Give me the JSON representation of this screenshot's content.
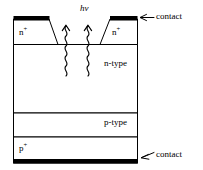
{
  "figure": {
    "type": "semiconductor-cross-section"
  },
  "colors": {
    "line": "#000000",
    "fill": "#ffffff",
    "contact_metal": "#000000",
    "background": "#ffffff"
  },
  "layers": [
    {
      "id": "nplus",
      "label": "n",
      "superscript": "+",
      "label_align": "left"
    },
    {
      "id": "ntype",
      "label": "n-type",
      "superscript": "",
      "label_align": "right"
    },
    {
      "id": "ptype",
      "label": "p-type",
      "superscript": "",
      "label_align": "right"
    },
    {
      "id": "pplus",
      "label": "p",
      "superscript": "+",
      "label_align": "left"
    }
  ],
  "labels": {
    "nplus_left": "n",
    "nplus_left_sup": "+",
    "nplus_right": "n",
    "nplus_right_sup": "+",
    "ntype": "n-type",
    "ptype": "p-type",
    "pplus": "p",
    "pplus_sup": "+",
    "photon": "hν",
    "contact_top": "contact",
    "contact_bottom": "contact"
  },
  "annotations": [
    {
      "id": "contact-top-arrow",
      "text": "contact",
      "points_to": "top-metal-contact",
      "direction": "left"
    },
    {
      "id": "contact-bottom-arrow",
      "text": "contact",
      "points_to": "bottom-metal-contact",
      "direction": "left-down"
    }
  ],
  "photons": {
    "count": 2,
    "symbol": "hν",
    "style": "wavy-arrow-upward",
    "note": "Two squiggly vertical rays with upward arrowheads representing incident photon absorption"
  }
}
